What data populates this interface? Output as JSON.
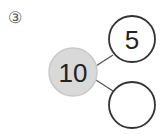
{
  "problem": {
    "number_label": "③",
    "whole": "10",
    "part_top": "5",
    "part_bottom": ""
  },
  "colors": {
    "whole_fill": "#d9d9d9",
    "whole_stroke": "#c4c4c4",
    "part_stroke": "#333333",
    "line": "#555555"
  }
}
